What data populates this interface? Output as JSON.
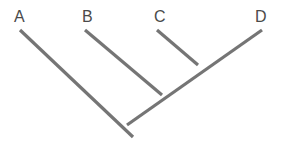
{
  "diagram": {
    "kind": "cladogram",
    "title": "",
    "background_color": "#ffffff",
    "branch_color": "#757575",
    "label_color": "#4a4a4a",
    "branch_width": 3.2,
    "width": 283,
    "height": 148
  },
  "labels": [
    {
      "id": "A",
      "text": "A",
      "x": 14,
      "y": 9
    },
    {
      "id": "B",
      "text": "B",
      "x": 82,
      "y": 9
    },
    {
      "id": "C",
      "text": "C",
      "x": 154,
      "y": 9
    },
    {
      "id": "D",
      "text": "D",
      "x": 255,
      "y": 9
    }
  ],
  "nodes": {
    "root": {
      "name": "root",
      "x": 127,
      "y": 125
    },
    "tip_a": {
      "name": "tip-a",
      "x": 20,
      "y": 30
    },
    "tip_b": {
      "name": "tip-b",
      "x": 85,
      "y": 30
    },
    "tip_c": {
      "name": "tip-c",
      "x": 157,
      "y": 30
    },
    "tip_d": {
      "name": "tip-d",
      "x": 262,
      "y": 30
    },
    "node_bcd": {
      "name": "node-bcd",
      "x": 162,
      "y": 95
    },
    "node_cd": {
      "name": "node-cd",
      "x": 198,
      "y": 65
    },
    "root_tail": {
      "name": "root-tail",
      "x": 133,
      "y": 137
    }
  },
  "branches": [
    {
      "name": "branch-a",
      "from": "tip_a",
      "to": "root_tail",
      "x1": 20,
      "y1": 30,
      "x2": 133,
      "y2": 137
    },
    {
      "name": "branch-b",
      "from": "tip_b",
      "to": "node_bcd",
      "x1": 85,
      "y1": 30,
      "x2": 162,
      "y2": 95
    },
    {
      "name": "branch-c",
      "from": "tip_c",
      "to": "node_cd",
      "x1": 157,
      "y1": 30,
      "x2": 198,
      "y2": 65
    },
    {
      "name": "branch-d-spine",
      "from": "tip_d",
      "to": "root",
      "x1": 262,
      "y1": 30,
      "x2": 127,
      "y2": 125
    }
  ]
}
